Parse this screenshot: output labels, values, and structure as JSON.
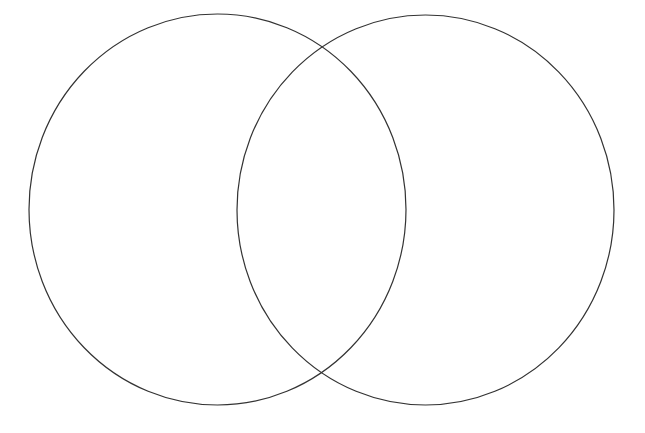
{
  "diagram": {
    "type": "venn",
    "background": "#ffffff",
    "stroke_color": "#333333",
    "stroke_width": 1.2,
    "sets": [
      {
        "id": "left-set",
        "cx": 217.5,
        "cy": 209.5,
        "rx": 188.5,
        "ry": 195.5,
        "label": ""
      },
      {
        "id": "right-set",
        "cx": 425.5,
        "cy": 210,
        "rx": 188.5,
        "ry": 195,
        "label": ""
      }
    ],
    "intersections": [
      {
        "x": 320,
        "y": 46
      },
      {
        "x": 320,
        "y": 373
      }
    ]
  }
}
